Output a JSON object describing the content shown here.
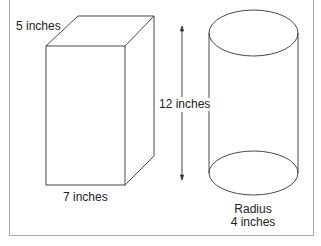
{
  "diagram": {
    "shapes": [
      {
        "name": "rectangular-prism",
        "labels": {
          "depth": "5 inches",
          "width": "7 inches"
        }
      },
      {
        "name": "cylinder",
        "labels": {
          "height": "12 inches",
          "radius_title": "Radius",
          "radius_value": "4 inches"
        }
      }
    ],
    "labels": {
      "prism_depth": "5 inches",
      "prism_width": "7 inches",
      "height": "12 inches",
      "radius_title": "Radius",
      "radius_value": "4 inches"
    },
    "colors": {
      "stroke": "#333333",
      "frame": "#a8a8a8"
    }
  }
}
